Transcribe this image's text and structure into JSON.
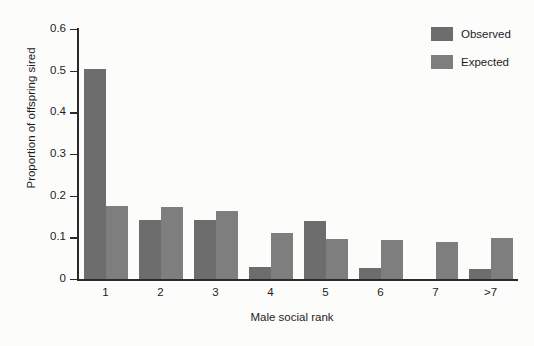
{
  "chart_data": {
    "type": "bar",
    "title": "",
    "subtitle": "",
    "xlabel": "Male social rank",
    "ylabel": "Proportion of offspring sired",
    "categories": [
      "1",
      "2",
      "3",
      "4",
      "5",
      "6",
      "7",
      ">7"
    ],
    "series": [
      {
        "name": "Observed",
        "color": "#6d6d6d",
        "values": [
          0.503,
          0.141,
          0.142,
          0.03,
          0.14,
          0.027,
          0.0,
          0.025
        ]
      },
      {
        "name": "Expected",
        "color": "#7e7e7e",
        "values": [
          0.175,
          0.173,
          0.164,
          0.111,
          0.095,
          0.094,
          0.089,
          0.099
        ]
      }
    ],
    "ylim": [
      0,
      0.6
    ],
    "yticks": [
      "0",
      "0.1",
      "0.2",
      "0.3",
      "0.4",
      "0.5",
      "0.6"
    ],
    "ytick_values": [
      0,
      0.1,
      0.2,
      0.3,
      0.4,
      0.5,
      0.6
    ],
    "xticks": [
      "1",
      "2",
      "3",
      "4",
      "5",
      "6",
      "7",
      ">7"
    ],
    "grid": false,
    "legend_position": "top-right",
    "legend": [
      "Observed",
      "Expected"
    ],
    "annotations": [],
    "background_color": "#fcfcfb",
    "axis_color": "#2a2a2a"
  }
}
